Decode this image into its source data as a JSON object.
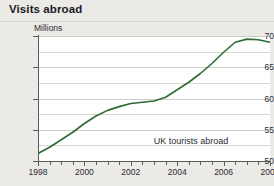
{
  "header": {
    "title": "Visits abroad"
  },
  "chart_data": {
    "type": "line",
    "title": "Visits abroad",
    "subtitle": "Millions",
    "ylabel": "Millions",
    "xlabel": "",
    "ylim": [
      50,
      70
    ],
    "xlim": [
      1998,
      2008
    ],
    "grid": true,
    "legend_position": "inline-annotation",
    "y_ticks": [
      50,
      55,
      60,
      65,
      70
    ],
    "y_gridlines": [
      50,
      52.5,
      55,
      57.5,
      60,
      62.5,
      65,
      67.5,
      70
    ],
    "x_ticks": [
      1998,
      2000,
      2002,
      2004,
      2006,
      2008
    ],
    "x_minor_tick_step": 0.5,
    "line_color": "#2d6b35",
    "annotations": [
      {
        "text": "UK tourists abroad",
        "x": 2004.6,
        "y": 53.2
      }
    ],
    "series": [
      {
        "name": "UK tourists abroad",
        "color": "#2d6b35",
        "x": [
          1998,
          1998.5,
          1999,
          1999.5,
          2000,
          2000.5,
          2001,
          2001.5,
          2002,
          2002.5,
          2003,
          2003.5,
          2004,
          2004.5,
          2005,
          2005.5,
          2006,
          2006.5,
          2007,
          2007.5,
          2008
        ],
        "values": [
          51.2,
          52.2,
          53.4,
          54.6,
          56.0,
          57.2,
          58.1,
          58.7,
          59.2,
          59.4,
          59.6,
          60.2,
          61.4,
          62.6,
          64.0,
          65.6,
          67.4,
          69.0,
          69.5,
          69.4,
          69.0
        ]
      }
    ]
  }
}
